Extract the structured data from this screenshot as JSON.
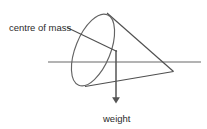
{
  "diagram": {
    "background_color": "#ffffff",
    "stroke_color": "#555555",
    "text_color": "#2b2b2b",
    "labels": {
      "centre_of_mass": "centre of mass",
      "weight": "weight"
    },
    "shapes": {
      "axis_line": {
        "name": "horizontal axis line",
        "x1": 48,
        "y1": 62,
        "x2": 201,
        "y2": 62
      },
      "cone_base_ellipse": {
        "name": "cone base ellipse",
        "cx": 93,
        "cy": 50,
        "rx": 17,
        "ry": 38,
        "rotation": 22
      },
      "cone_upper_edge": {
        "name": "cone upper slant edge",
        "x1": 107,
        "y1": 13,
        "x2": 173,
        "y2": 71
      },
      "cone_lower_edge": {
        "name": "cone lower slant edge",
        "x1": 85,
        "y1": 86,
        "x2": 173,
        "y2": 71
      },
      "leader_line": {
        "name": "centre of mass leader line",
        "x1": 67,
        "y1": 27,
        "x2": 117,
        "y2": 51
      },
      "weight_arrow": {
        "name": "weight force arrow",
        "x": 116,
        "y_start": 50,
        "y_end": 104,
        "direction": "down"
      }
    },
    "label_positions": {
      "centre_of_mass": {
        "x": 9,
        "y": 31
      },
      "weight": {
        "x": 103,
        "y": 122
      }
    }
  }
}
